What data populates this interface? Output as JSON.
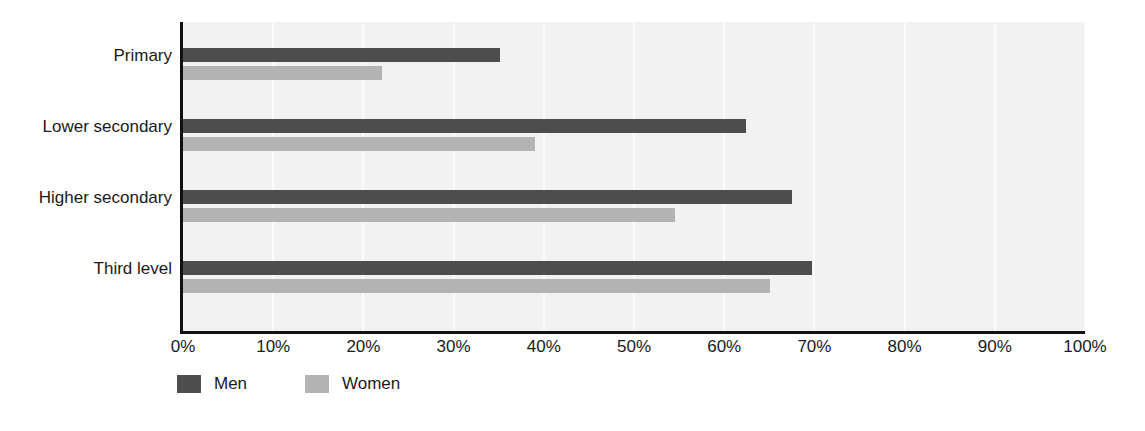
{
  "chart_data": {
    "type": "bar",
    "orientation": "horizontal",
    "title": "",
    "subtitle": "",
    "xlabel": "",
    "ylabel": "",
    "xlim": [
      0,
      100
    ],
    "x_tick_labels": [
      "0%",
      "10%",
      "20%",
      "30%",
      "40%",
      "50%",
      "60%",
      "70%",
      "80%",
      "90%",
      "100%"
    ],
    "x_tick_values": [
      0,
      10,
      20,
      30,
      40,
      50,
      60,
      70,
      80,
      90,
      100
    ],
    "categories": [
      "Primary",
      "Lower secondary",
      "Higher secondary",
      "Third level"
    ],
    "series": [
      {
        "name": "Men",
        "color": "#4d4d4d",
        "values": [
          35.1,
          62.4,
          67.5,
          69.7
        ]
      },
      {
        "name": "Women",
        "color": "#b3b3b3",
        "values": [
          22.1,
          39.0,
          54.5,
          65.1
        ]
      }
    ],
    "legend_position": "bottom-left",
    "grid": true,
    "grid_axis": "x",
    "plot_background": "#f2f2f2",
    "axis_color": "#111111"
  },
  "legend": {
    "items": [
      {
        "label": "Men",
        "color": "#4d4d4d"
      },
      {
        "label": "Women",
        "color": "#b3b3b3"
      }
    ]
  },
  "axis": {
    "categories": [
      "Primary",
      "Lower secondary",
      "Higher secondary",
      "Third level"
    ],
    "ticks": [
      "0%",
      "10%",
      "20%",
      "30%",
      "40%",
      "50%",
      "60%",
      "70%",
      "80%",
      "90%",
      "100%"
    ]
  }
}
